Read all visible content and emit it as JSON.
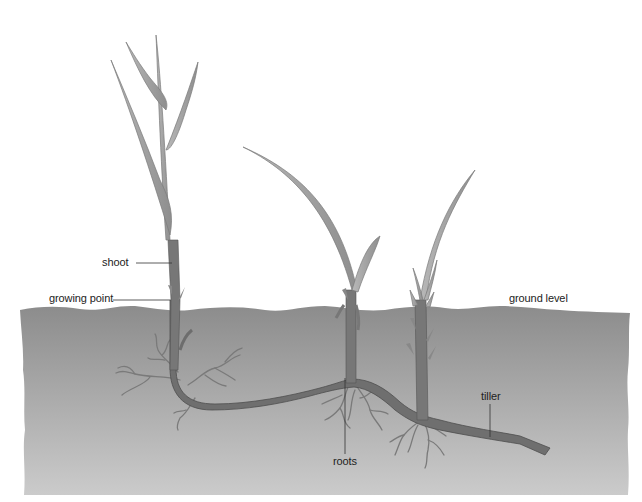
{
  "diagram": {
    "labels": {
      "shoot": "shoot",
      "growing_point": "growing point",
      "ground_level": "ground level",
      "tiller": "tiller",
      "roots": "roots"
    },
    "colors": {
      "background": "#ffffff",
      "soil_top": "#8e8e8e",
      "soil_bottom": "#c9c9c9",
      "stem": "#6f6f6f",
      "stem_outline": "#4a4a4a",
      "leaf": "#a8a8a8",
      "leaf_outline": "#7a7a7a",
      "root": "#7a7a7a",
      "leader_line": "#333333",
      "text": "#222222"
    }
  }
}
